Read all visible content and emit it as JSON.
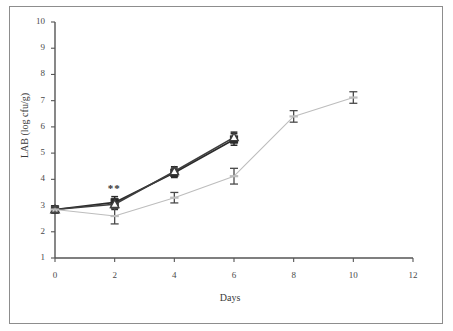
{
  "figure": {
    "background": "#ffffff",
    "border_color": "#8d8d8d"
  },
  "chart_data": {
    "type": "line",
    "title": "",
    "xlabel": "Days",
    "ylabel": "LAB (log cfu/g)",
    "xlim": [
      0,
      12
    ],
    "ylim": [
      1,
      10
    ],
    "xticks": [
      0,
      2,
      4,
      6,
      8,
      10,
      12
    ],
    "xticklabels": [
      "0",
      "2",
      "4",
      "6",
      "8",
      "10",
      "12"
    ],
    "yticks": [
      1,
      2,
      3,
      4,
      5,
      6,
      7,
      8,
      9,
      10
    ],
    "yticklabels": [
      "1",
      "2",
      "3",
      "4",
      "5",
      "6",
      "7",
      "8",
      "9",
      "10"
    ],
    "grid": false,
    "legend": "none",
    "series": [
      {
        "name": "dark-series-a",
        "color": "#2b2b2b",
        "marker": "square",
        "x": [
          0,
          2,
          4,
          6
        ],
        "values": [
          2.85,
          3.12,
          4.25,
          5.52
        ],
        "errors": [
          0.12,
          0.22,
          0.18,
          0.22
        ]
      },
      {
        "name": "dark-series-b",
        "color": "#3d3d3d",
        "marker": "triangle",
        "x": [
          0,
          2,
          4,
          6
        ],
        "values": [
          2.85,
          3.05,
          4.3,
          5.6
        ],
        "errors": [
          0.12,
          0.2,
          0.18,
          0.2
        ]
      },
      {
        "name": "gray-series-c",
        "color": "#bdbdbd",
        "marker": "dash",
        "x": [
          0,
          2,
          4,
          6,
          8,
          10
        ],
        "values": [
          2.85,
          2.6,
          3.3,
          4.12,
          6.4,
          7.12
        ],
        "errors": [
          0.1,
          0.3,
          0.2,
          0.3,
          0.22,
          0.22
        ]
      }
    ],
    "annotations": [
      {
        "text": "**",
        "x": 2,
        "y": 3.55
      }
    ]
  }
}
